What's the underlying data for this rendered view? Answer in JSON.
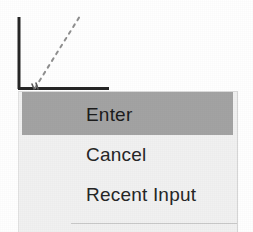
{
  "screen": {
    "width": 253,
    "height": 232,
    "background_color": "#ffffff"
  },
  "plot": {
    "name": "axis-with-dashed-trend",
    "axis_color": "#262626",
    "dashed_line_color": "#8a8a8a",
    "y_axis": {
      "x": 18,
      "y_top": 17,
      "y_bottom": 89
    },
    "x_axis": {
      "y": 89,
      "x_left": 18,
      "x_right": 109
    },
    "dashed_trend": {
      "x1": 35,
      "y1": 88,
      "x2": 80,
      "y2": 16
    }
  },
  "context_menu": {
    "name": "context-menu",
    "background_color": "#f1f1f1",
    "highlight_color": "#a3a3a3",
    "text_color": "#262626",
    "separator_color": "#c9c9c9",
    "items": [
      {
        "label": "Enter",
        "highlighted": true
      },
      {
        "label": "Cancel",
        "highlighted": false
      },
      {
        "label": "Recent Input",
        "highlighted": false
      }
    ]
  }
}
